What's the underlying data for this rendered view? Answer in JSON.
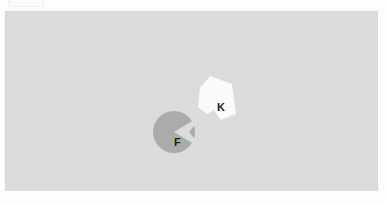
{
  "scene": {
    "title": "shape-matching-stimulus",
    "background_color": "#fdfdfd",
    "panel": {
      "name": "stimulus-canvas",
      "fill": "#dcdcdc",
      "x": 5,
      "y": 11,
      "width": 373,
      "height": 180
    },
    "top_artifact": {
      "name": "clipped-toolbar-fragment",
      "fill": "#fafbfc",
      "border": "#eceef0"
    }
  },
  "shapes": [
    {
      "id": "shape-f",
      "label": "F",
      "kind": "pacman-circle",
      "fill": "#ababab",
      "label_color": "#1d1d1d",
      "center_x": 174,
      "center_y": 132,
      "radius": 21,
      "notch_side": "right",
      "notch_angle_deg": 62
    },
    {
      "id": "shape-k",
      "label": "K",
      "kind": "notched-quadrilateral",
      "fill": "#fbfbfb",
      "label_color": "#1d1d1d",
      "center_x": 217,
      "center_y": 97,
      "points": "210,76 232,84 236,114 221,120 214,110 207,114 198,107 200,88"
    }
  ],
  "labels": {
    "f": "F",
    "k": "K"
  },
  "colors": {
    "panel_gray": "#dcdcdc",
    "shape_gray": "#ababab",
    "shape_white": "#fbfbfb",
    "text_dark": "#1d1d1d",
    "page_white": "#fdfdfd"
  }
}
